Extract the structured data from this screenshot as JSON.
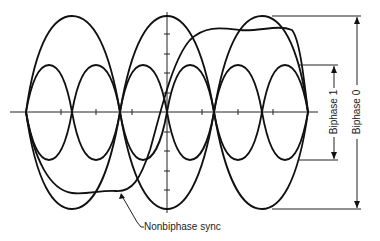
{
  "figure": {
    "type": "eye-pattern diagram",
    "annotations": {
      "biphase_1": "Biphase 1",
      "biphase_0": "Biphase 0",
      "nonbiphase_sync": "Nonbiphase sync"
    },
    "axis": {
      "horizontal_ticks": 13,
      "vertical_ticks": 8
    },
    "colors": {
      "stroke": "#111111",
      "background": "#ffffff"
    }
  }
}
